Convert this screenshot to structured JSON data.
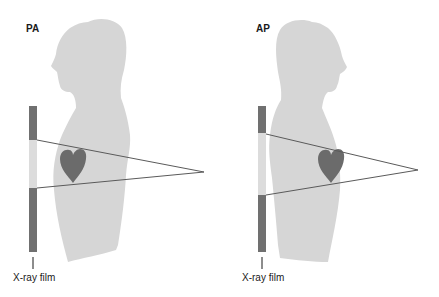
{
  "colors": {
    "body": "#d6d6d6",
    "heart": "#6b6b6b",
    "film_dark": "#707070",
    "film_light": "#dcdcdc",
    "beam": "#5a5a5a",
    "text": "#1a1a1a"
  },
  "panels": [
    {
      "label": "PA",
      "film_label": "X-ray film",
      "facing": "left"
    },
    {
      "label": "AP",
      "film_label": "X-ray film",
      "facing": "right"
    }
  ]
}
